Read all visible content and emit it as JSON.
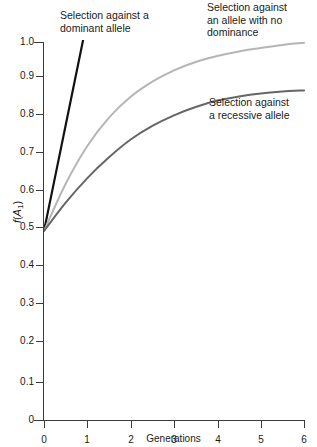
{
  "chart_data": {
    "type": "line",
    "title": "",
    "xlabel": "Generations",
    "ylabel": "f(A1)",
    "xlim": [
      0,
      6
    ],
    "ylim": [
      0,
      1.0
    ],
    "grid": false,
    "legend_position": "inline-annotations",
    "xticks": [
      "0",
      "1",
      "2",
      "3",
      "4",
      "5",
      "6"
    ],
    "yticks": [
      "0",
      "0.1",
      "0.2",
      "0.3",
      "0.4",
      "0.5",
      "0.6",
      "0.7",
      "0.8",
      "0.9",
      "1.0"
    ],
    "x": [
      0,
      0.5,
      1,
      1.5,
      2,
      2.5,
      3,
      3.5,
      4,
      4.5,
      5,
      5.5,
      6
    ],
    "series": [
      {
        "name": "Selection against a dominant allele",
        "color": "#111111",
        "clipped_above_axis": true,
        "values": [
          0.5,
          0.78,
          1.06,
          1.34,
          1.62,
          1.9,
          2.18,
          2.46,
          2.74,
          3.02,
          3.3,
          3.58,
          3.86
        ]
      },
      {
        "name": "Selection against an allele with no dominance",
        "color": "#b5b5b5",
        "clipped_above_axis": false,
        "values": [
          0.5,
          0.625,
          0.725,
          0.8,
          0.855,
          0.895,
          0.925,
          0.947,
          0.963,
          0.975,
          0.984,
          0.992,
          0.998
        ]
      },
      {
        "name": "Selection against a recessive allele",
        "color": "#666666",
        "clipped_above_axis": false,
        "values": [
          0.5,
          0.575,
          0.64,
          0.695,
          0.742,
          0.778,
          0.806,
          0.828,
          0.845,
          0.856,
          0.864,
          0.869,
          0.872
        ]
      }
    ],
    "annotations": [
      {
        "id": "dominant",
        "text": "Selection against a dominant allele",
        "lines": [
          "Selection against a",
          "dominant allele"
        ]
      },
      {
        "id": "no-dominance",
        "text": "Selection against an allele with no dominance",
        "lines": [
          "Selection against",
          "an allele with no",
          "dominance"
        ]
      },
      {
        "id": "recessive",
        "text": "Selection against a recessive allele",
        "lines": [
          "Selection against",
          "a recessive allele"
        ]
      }
    ]
  },
  "axes": {
    "y_label_main": "f",
    "y_label_paren_open": "(",
    "y_label_var": "A",
    "y_label_sub": "1",
    "y_label_paren_close": ")",
    "x_title": "Generations"
  },
  "y_ticks": [
    {
      "value": "1.0",
      "y": 42
    },
    {
      "value": "0.9",
      "y": 76
    },
    {
      "value": "0.8",
      "y": 114
    },
    {
      "value": "0.7",
      "y": 152
    },
    {
      "value": "0.6",
      "y": 190
    },
    {
      "value": "0.5",
      "y": 227
    },
    {
      "value": "0.4",
      "y": 265
    },
    {
      "value": "0.3",
      "y": 303
    },
    {
      "value": "0.2",
      "y": 341
    },
    {
      "value": "0.1",
      "y": 382
    },
    {
      "value": "0",
      "y": 420
    }
  ],
  "x_ticks": [
    {
      "value": "0",
      "x": 44
    },
    {
      "value": "1",
      "x": 87
    },
    {
      "value": "2",
      "x": 131
    },
    {
      "value": "3",
      "x": 174
    },
    {
      "value": "4",
      "x": 218
    },
    {
      "value": "5",
      "x": 261
    },
    {
      "value": "6",
      "x": 304
    }
  ],
  "annotations": {
    "dominant_l1": "Selection against a",
    "dominant_l2": "dominant allele",
    "nodom_l1": "Selection against",
    "nodom_l2": "an allele with no",
    "nodom_l3": "dominance",
    "recessive_l1": "Selection against",
    "recessive_l2": "a recessive allele"
  }
}
